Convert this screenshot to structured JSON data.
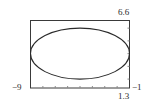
{
  "chart_data": {
    "type": "line",
    "title": "",
    "xlabel": "",
    "ylabel": "",
    "xlim": [
      -9,
      -1
    ],
    "ylim": [
      1.3,
      6.6
    ],
    "grid": false,
    "legend": null,
    "x_tick_step": 1,
    "y_tick_step": 1,
    "series": [
      {
        "name": "ellipse",
        "shape": "ellipse",
        "center": [
          -5,
          4
        ],
        "semi_axis_x": 4,
        "semi_axis_y": 2
      }
    ],
    "corner_labels": {
      "xmin": "−9",
      "xmax": "−1",
      "ymax": "6.6",
      "ymin": "1.3"
    }
  },
  "colors": {
    "frame": "#3a3a3a",
    "curve": "#2a2a2a",
    "ticks": "#8a8a8a"
  }
}
